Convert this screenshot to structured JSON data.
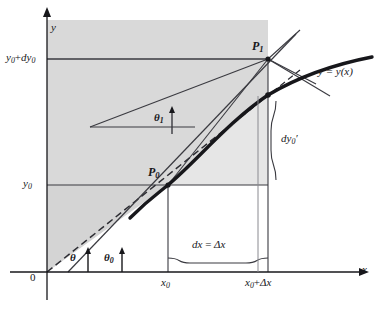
{
  "figure": {
    "background_color": "#ffffff",
    "shade_color": "#cfcfcf",
    "ink_color": "#17171b"
  },
  "axes": {
    "x_label": "x",
    "y_label": "y",
    "origin_label": "0",
    "x_axis_y_px": 272,
    "y_axis_x_px": 47,
    "arrow": "triangle"
  },
  "ticks": {
    "x": [
      {
        "label_plain": "x0",
        "base": "x",
        "sub": "0",
        "x_px": 168
      },
      {
        "label_plain": "x0+Δx",
        "base": "x",
        "sub": "0",
        "suffix": "+Δx",
        "x_px": 268
      }
    ],
    "y": [
      {
        "label_plain": "y0",
        "base": "y",
        "sub": "0",
        "y_px": 185
      },
      {
        "label_plain": "y0+dy0",
        "base": "y",
        "sub": "0",
        "suffix": "+dy",
        "suffix_sub": "0",
        "y_px": 59
      }
    ]
  },
  "points": [
    {
      "name": "P0",
      "base": "P",
      "sub": "0",
      "x_px": 168,
      "y_px": 185,
      "label_dx": -18,
      "label_dy": -16
    },
    {
      "name": "P1",
      "base": "P",
      "sub": "1",
      "x_px": 268,
      "y_px": 59,
      "label_dx": -14,
      "label_dy": -18
    },
    {
      "name": "Q",
      "base": "",
      "sub": "",
      "x_px": 268,
      "y_px": 95,
      "label_dx": 0,
      "label_dy": 0
    }
  ],
  "curve": {
    "label": "y = y(x)",
    "label_x_px": 318,
    "label_y_px": 72,
    "stroke_width": 3.2
  },
  "angles": [
    {
      "name": "theta",
      "glyph": "θ",
      "sub": "",
      "x_px": 76,
      "y_px": 258,
      "vertex_x_px": 47,
      "vertex_y_px": 272
    },
    {
      "name": "theta0",
      "glyph": "θ",
      "sub": "0",
      "x_px": 110,
      "y_px": 258,
      "vertex_x_px": 68,
      "vertex_y_px": 272
    },
    {
      "name": "theta1",
      "glyph": "θ",
      "sub": "1",
      "x_px": 161,
      "y_px": 118,
      "vertex_x_px": 160,
      "vertex_y_px": 127
    }
  ],
  "braces": [
    {
      "name": "dx-brace",
      "label_base": "dx = Δx",
      "orientation": "horizontal",
      "x_px": 218,
      "y_px": 249
    },
    {
      "name": "dy0prime-brace",
      "label_base": "dy",
      "label_sub": "0",
      "label_suffix": "′",
      "orientation": "vertical",
      "x_px": 283,
      "y_px": 140
    }
  ],
  "lines": [
    {
      "name": "secant-P0-P1",
      "style": "solid"
    },
    {
      "name": "tangent-at-P0",
      "style": "solid"
    },
    {
      "name": "ray-through-origin",
      "style": "dashed"
    },
    {
      "name": "chord-P1-lower",
      "style": "dashed"
    },
    {
      "name": "theta1-reference",
      "style": "solid"
    }
  ]
}
